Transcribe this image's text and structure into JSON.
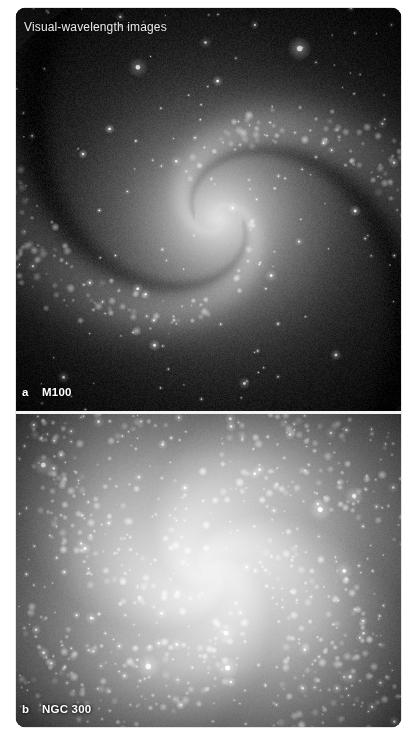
{
  "figure": {
    "title": "Visual-wavelength images",
    "background_color": "#050505",
    "frame_border_color": "#c9c9c9",
    "divider_color": "#f2f2f2",
    "label_color": "#ffffff",
    "title_color": "#e9e9e9"
  },
  "panels": [
    {
      "letter": "a",
      "name": "M100",
      "object_type": "grand-design spiral galaxy",
      "rendering": {
        "core_x": 0.525,
        "core_y": 0.52,
        "core_radius": 0.085,
        "disk_radius": 0.455,
        "arm_count": 2,
        "arm_pitch": 0.62,
        "arm_width": 0.3,
        "rotation": 0.35,
        "brightness": 0.86,
        "knot_count": 340,
        "star_count": 150,
        "dust_lanes": true
      }
    },
    {
      "letter": "b",
      "name": "NGC 300",
      "object_type": "flocculent spiral galaxy",
      "rendering": {
        "core_x": 0.505,
        "core_y": 0.505,
        "core_radius": 0.2,
        "disk_radius": 0.47,
        "arm_count": 4,
        "arm_pitch": 0.88,
        "arm_width": 0.52,
        "rotation": 1.1,
        "brightness": 1.22,
        "knot_count": 620,
        "star_count": 300,
        "dust_lanes": false
      }
    }
  ]
}
